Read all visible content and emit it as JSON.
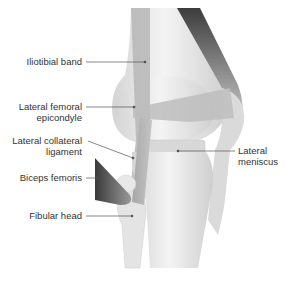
{
  "diagram": {
    "type": "anatomical-illustration",
    "colors": {
      "bone": "#ebebeb",
      "bone_shadow": "#cfcfcf",
      "ligament": "#b8b8b8",
      "muscle_dark": "#555555",
      "leader_line": "#555555",
      "text": "#333333"
    },
    "labels": [
      {
        "id": "iliotibial-band",
        "line1": "Iliotibial band",
        "line2": ""
      },
      {
        "id": "lateral-femoral-epicondyle",
        "line1": "Lateral femoral",
        "line2": "epicondyle"
      },
      {
        "id": "lateral-collateral-ligament",
        "line1": "Lateral collateral",
        "line2": "ligament"
      },
      {
        "id": "biceps-femoris",
        "line1": "Biceps femoris",
        "line2": ""
      },
      {
        "id": "fibular-head",
        "line1": "Fibular head",
        "line2": ""
      },
      {
        "id": "lateral-meniscus",
        "line1": "Lateral",
        "line2": "meniscus"
      }
    ]
  }
}
